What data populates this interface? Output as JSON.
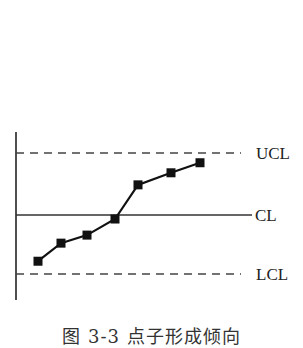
{
  "chart_data": {
    "type": "line",
    "title": "",
    "caption": "图 3-3  点子形成倾向",
    "xlabel": "",
    "ylabel": "",
    "x": [
      1,
      2,
      3,
      4,
      5,
      6,
      7
    ],
    "series": [
      {
        "name": "points",
        "marker": "square",
        "values": [
          -2.3,
          -1.4,
          -1.0,
          -0.2,
          1.5,
          2.1,
          2.6
        ]
      }
    ],
    "reference_lines": [
      {
        "label": "UCL",
        "value": 3,
        "style": "dashed"
      },
      {
        "label": "CL",
        "value": 0,
        "style": "solid"
      },
      {
        "label": "LCL",
        "value": -3,
        "style": "dashed"
      }
    ],
    "ylim": [
      -4.3,
      4.1
    ],
    "grid": false,
    "legend": "none"
  },
  "labels": {
    "ucl": "UCL",
    "cl": "CL",
    "lcl": "LCL"
  },
  "caption": "图 3-3  点子形成倾向",
  "colors": {
    "line": "#111111",
    "marker": "#111111",
    "text": "#222222"
  }
}
